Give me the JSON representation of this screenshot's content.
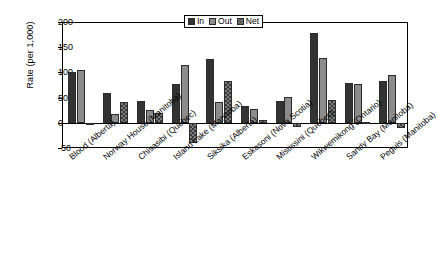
{
  "chart_data": {
    "type": "bar",
    "title": "",
    "xlabel": "",
    "ylabel": "Rate (per 1,000)",
    "ylim": [
      -50,
      200
    ],
    "yticks": [
      -50,
      0,
      50,
      100,
      150,
      200
    ],
    "ytick_labels": [
      "-50",
      "0",
      "50",
      "100",
      "150",
      "200"
    ],
    "grid": false,
    "legend_position": "top-center",
    "categories": [
      "Blood (Alberta)",
      "Norway House (Manitoba)",
      "Chisasibi (Quebec)",
      "Island Lake (Manitoba)",
      "Siksika (Alberta)",
      "Eskasoni (Nova Scotia)",
      "Mistissini (Quebec)",
      "Wikwemikong (Ontario)",
      "Sandy Bay (Manitoba)",
      "Peguis (Manitoba)"
    ],
    "series": [
      {
        "name": "In",
        "color": "#333333",
        "values": [
          100,
          60,
          44,
          76,
          127,
          34,
          44,
          178,
          78,
          83
        ]
      },
      {
        "name": "Out",
        "color": "#8c8c8c",
        "values": [
          105,
          17,
          25,
          114,
          42,
          27,
          52,
          128,
          76,
          94
        ]
      },
      {
        "name": "Net",
        "color": "#7d7d7d",
        "values": [
          -4,
          42,
          19,
          -40,
          83,
          5,
          -9,
          46,
          1,
          -11
        ]
      }
    ]
  }
}
